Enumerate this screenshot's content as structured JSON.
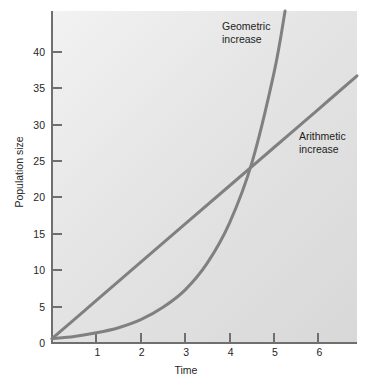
{
  "chart_data": {
    "type": "line",
    "title": "",
    "xlabel": "Time",
    "ylabel": "Population size",
    "xlim": [
      0,
      6.87
    ],
    "ylim": [
      0,
      45.6
    ],
    "grid": false,
    "legend_position": "inline-annotations",
    "x_ticks": [
      "1",
      "2",
      "3",
      "4",
      "5",
      "6"
    ],
    "x_tick_values": [
      1,
      2,
      3,
      4,
      5,
      6
    ],
    "y_ticks": [
      "0",
      "5",
      "10",
      "15",
      "20",
      "25",
      "30",
      "35",
      "40"
    ],
    "y_tick_values": [
      0,
      5,
      10,
      15,
      20,
      25,
      30,
      35,
      40
    ],
    "series": [
      {
        "name": "Arithmetic increase",
        "annotation": "Arithmetic\nincrease",
        "color": "#808080",
        "x": [
          0,
          1,
          2,
          3,
          4,
          5,
          6,
          6.87
        ],
        "values": [
          0.6,
          5.85,
          11.1,
          16.35,
          21.6,
          26.85,
          32.1,
          36.7
        ]
      },
      {
        "name": "Geometric increase",
        "annotation": "Geometric\nincrease",
        "color": "#808080",
        "x": [
          0,
          0.5,
          1,
          1.5,
          2,
          2.5,
          3,
          3.5,
          4,
          4.5,
          5,
          5.25
        ],
        "values": [
          0.6,
          0.9,
          1.4,
          2.1,
          3.2,
          4.9,
          7.3,
          11.0,
          16.5,
          24.7,
          37.1,
          45.6
        ]
      }
    ],
    "intersection": {
      "x": 4.4,
      "y": 23.5
    }
  },
  "axes": {
    "x_title": "Time",
    "y_title": "Population size"
  },
  "annotations": {
    "geometric": "Geometric\nincrease",
    "arithmetic": "Arithmetic\nincrease"
  },
  "colors": {
    "curve": "#808080",
    "axis": "#6f6f6f",
    "text": "#262626",
    "panel_light": "#f2f2f2",
    "panel_dark": "#d8d8d8",
    "page_background": "#ffffff"
  }
}
